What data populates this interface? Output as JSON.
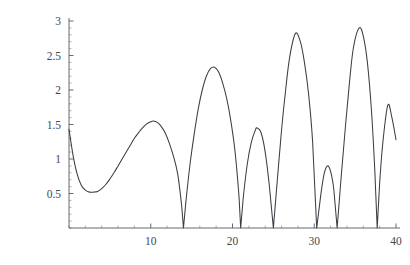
{
  "chart_data": {
    "type": "line",
    "title": "",
    "subtitle": "",
    "xlabel": "",
    "ylabel": "",
    "xlim": [
      0,
      40
    ],
    "ylim": [
      0,
      3
    ],
    "grid": false,
    "legend": null,
    "legend_position": "none",
    "x_ticks": [
      10,
      20,
      30,
      40
    ],
    "x_tick_labels": [
      "10",
      "20",
      "30",
      "40"
    ],
    "y_ticks": [
      0.5,
      1,
      1.5,
      2,
      2.5,
      3
    ],
    "y_tick_labels": [
      "0.5",
      "1",
      "1.5",
      "2",
      "2.5",
      "3"
    ],
    "x_minor_step": 2,
    "y_minor_step": 0.1,
    "line_color": "#3a3f44",
    "axis_color": "#555a5e",
    "background_color": "#ffffff",
    "series": [
      {
        "name": "curve",
        "x": [
          0,
          0.5,
          1,
          1.5,
          2,
          2.5,
          3,
          3.5,
          4,
          4.5,
          5,
          5.5,
          6,
          6.5,
          7,
          7.5,
          8,
          8.5,
          9,
          9.5,
          10,
          10.3,
          10.8,
          11.3,
          11.8,
          12.3,
          12.8,
          13.3,
          13.8,
          14,
          14.3,
          14.8,
          15.3,
          15.8,
          16.3,
          16.8,
          17.3,
          17.8,
          18.3,
          18.8,
          19.3,
          19.8,
          20.3,
          20.8,
          21,
          21.3,
          21.8,
          22.3,
          22.8,
          23,
          23.5,
          24,
          24.5,
          25,
          25.5,
          26,
          26.5,
          27,
          27.7,
          28.3,
          28.8,
          29.3,
          29.8,
          30.3,
          30.8,
          31.2,
          31.6,
          32,
          32.4,
          32.8,
          33.3,
          33.8,
          34.3,
          34.8,
          35.5,
          36,
          36.5,
          37,
          37.4,
          37.7,
          38,
          38.4,
          39,
          39.5,
          40
        ],
        "y": [
          1.43,
          1.05,
          0.78,
          0.62,
          0.55,
          0.52,
          0.52,
          0.53,
          0.57,
          0.63,
          0.71,
          0.8,
          0.9,
          1.0,
          1.1,
          1.2,
          1.3,
          1.38,
          1.45,
          1.51,
          1.54,
          1.55,
          1.53,
          1.47,
          1.37,
          1.22,
          1.03,
          0.78,
          0.3,
          0.0,
          0.38,
          0.92,
          1.35,
          1.72,
          2.0,
          2.2,
          2.31,
          2.33,
          2.26,
          2.1,
          1.87,
          1.55,
          1.12,
          0.45,
          0.0,
          0.42,
          0.92,
          1.24,
          1.42,
          1.45,
          1.38,
          1.1,
          0.62,
          0.0,
          0.72,
          1.42,
          2.0,
          2.48,
          2.82,
          2.7,
          2.4,
          1.95,
          1.25,
          0.0,
          0.48,
          0.78,
          0.9,
          0.82,
          0.55,
          0.0,
          0.75,
          1.45,
          2.1,
          2.62,
          2.9,
          2.78,
          2.4,
          1.7,
          0.85,
          0.0,
          0.65,
          1.25,
          1.78,
          1.6,
          1.28
        ],
        "zeros": [
          14,
          21,
          25,
          30.3,
          32.8,
          37.7
        ],
        "peaks": [
          {
            "x": 0,
            "y": 1.43
          },
          {
            "x": 10.3,
            "y": 1.55
          },
          {
            "x": 17.8,
            "y": 2.33
          },
          {
            "x": 23,
            "y": 1.45
          },
          {
            "x": 27.7,
            "y": 2.82
          },
          {
            "x": 31.6,
            "y": 0.9
          },
          {
            "x": 35.5,
            "y": 2.9
          },
          {
            "x": 39,
            "y": 1.78
          }
        ],
        "minima": [
          {
            "x": 3.0,
            "y": 0.52
          }
        ]
      }
    ]
  }
}
